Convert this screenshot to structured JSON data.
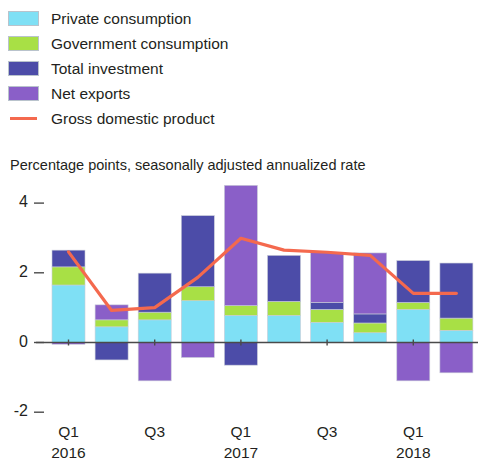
{
  "legend": {
    "items": [
      {
        "label": "Private consumption",
        "color": "#7FE0F5",
        "marker": "swatch"
      },
      {
        "label": "Government consumption",
        "color": "#A8E045",
        "marker": "swatch"
      },
      {
        "label": "Total investment",
        "color": "#4C4CA8",
        "marker": "swatch"
      },
      {
        "label": "Net exports",
        "color": "#8A5FC8",
        "marker": "swatch"
      },
      {
        "label": "Gross domestic product",
        "color": "#F4694E",
        "marker": "line"
      }
    ]
  },
  "subtitle": "Percentage points, seasonally adjusted annualized rate",
  "chart_data": {
    "type": "bar",
    "title": "",
    "subtitle": "Percentage points, seasonally adjusted annualized rate",
    "xlabel": "",
    "ylabel": "Percentage points, seasonally adjusted annualized rate",
    "ylim": [
      -2,
      4
    ],
    "yticks": [
      -2,
      0,
      2,
      4
    ],
    "ytick_labels": [
      "-2",
      "0",
      "2",
      "4"
    ],
    "grid": false,
    "legend_position": "top-left",
    "stacked": true,
    "categories": [
      "Q1 2016",
      "Q2 2016",
      "Q3 2016",
      "Q4 2016",
      "Q1 2017",
      "Q2 2017",
      "Q3 2017",
      "Q4 2017",
      "Q1 2018",
      "Q2 2018"
    ],
    "xtick_labels": [
      {
        "quarter": "Q1",
        "year": "2016",
        "index": 0
      },
      {
        "quarter": "Q3",
        "year": "",
        "index": 2
      },
      {
        "quarter": "Q1",
        "year": "2017",
        "index": 4
      },
      {
        "quarter": "Q3",
        "year": "",
        "index": 6
      },
      {
        "quarter": "Q1",
        "year": "2018",
        "index": 8
      }
    ],
    "series": [
      {
        "name": "Private consumption",
        "color": "#7FE0F5",
        "values": [
          1.65,
          0.45,
          0.65,
          1.2,
          0.78,
          0.78,
          0.58,
          0.28,
          0.95,
          0.35
        ]
      },
      {
        "name": "Government consumption",
        "color": "#A8E045",
        "values": [
          0.52,
          0.2,
          0.22,
          0.4,
          0.28,
          0.4,
          0.37,
          0.28,
          0.2,
          0.35
        ]
      },
      {
        "name": "Total investment",
        "color": "#4C4CA8",
        "values": [
          0.48,
          -0.5,
          1.12,
          2.04,
          -0.65,
          1.32,
          0.2,
          0.26,
          1.2,
          1.58
        ]
      },
      {
        "name": "Net exports",
        "color": "#8A5FC8",
        "values": [
          -0.05,
          0.43,
          -1.1,
          -0.43,
          3.45,
          0.0,
          1.43,
          1.75,
          -1.1,
          -0.87
        ]
      }
    ],
    "line_series": {
      "name": "Gross domestic product",
      "color": "#F4694E",
      "values": [
        2.6,
        0.92,
        1.0,
        1.87,
        2.99,
        2.65,
        2.59,
        2.5,
        1.41,
        1.41
      ]
    }
  }
}
